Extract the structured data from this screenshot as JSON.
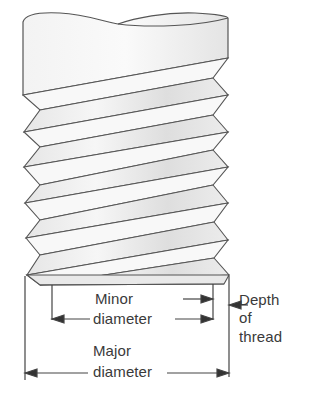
{
  "figure": {
    "colors": {
      "background": "#ffffff",
      "line": "#555555",
      "shade_light": "#f1f1f1",
      "shade_dark": "#dcdcdc",
      "text": "#3a3a3a"
    }
  },
  "labels": {
    "minor_diameter": {
      "line1": "Minor",
      "line2": "diameter"
    },
    "major_diameter": {
      "line1": "Major",
      "line2": "diameter"
    },
    "depth_of_thread": {
      "line1": "Depth",
      "line2": "of",
      "line3": "thread"
    }
  },
  "dimensions": [
    {
      "name": "Minor diameter",
      "from_x": 52,
      "to_x": 213
    },
    {
      "name": "Major diameter",
      "from_x": 25,
      "to_x": 228
    },
    {
      "name": "Depth of thread",
      "from_x": 213,
      "to_x": 228
    }
  ]
}
